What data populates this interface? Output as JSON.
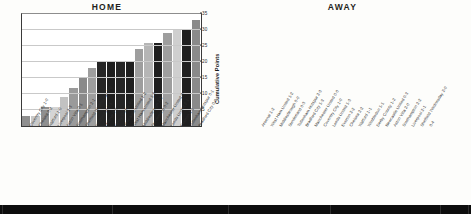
{
  "chart_data": [
    {
      "type": "bar",
      "title": "HOME",
      "xlabel": "",
      "ylabel": "Cumulative Points",
      "ylim": [
        0,
        35
      ],
      "yticks": [
        5,
        10,
        15,
        20,
        25,
        30,
        35
      ],
      "grid": true,
      "legend": "none",
      "categories": [
        "Coventry City 1-0",
        "Chelsea 0-2",
        "Watford 1-0",
        "Liverpool 2-3",
        "Aston Villa 0-1",
        "Southampton 2-1",
        "Sheffield Wednesday 3-0",
        "Wimbledon 2-1",
        "Arsenal 0-3",
        "Derby County 0-1",
        "Newcastle United 1-2",
        "West Ham United 1-3",
        "Middlesbrough 2-1",
        "Sunderland 0-2",
        "Manchester United 0-2",
        "Leeds United 2-1",
        "Everton 1-1",
        "Tottenham Hotspur 0-1",
        "Bradford City 0-0"
      ],
      "values": [
        3,
        3,
        6,
        6,
        9,
        12,
        15,
        18,
        20,
        20,
        20,
        20,
        24,
        26,
        26,
        29,
        30,
        30,
        33
      ],
      "bar_shades": [
        "#8f8f8f",
        "#c9c9c9",
        "#8f8f8f",
        "#d5d5d5",
        "#c2c2c2",
        "#9a9a9a",
        "#8a8a8a",
        "#9e9e9e",
        "#262626",
        "#1f1f1f",
        "#262626",
        "#1f1f1f",
        "#9e9e9e",
        "#b5b5b5",
        "#1f1f1f",
        "#9e9e9e",
        "#cfcfcf",
        "#1f1f1f",
        "#8a8a8a"
      ]
    },
    {
      "type": "bar",
      "title": "AWAY",
      "xlabel": "",
      "ylabel": "Cumulative Points",
      "ylim": [
        0,
        35
      ],
      "yticks": [
        5,
        10,
        15,
        20,
        25,
        30,
        35
      ],
      "grid": true,
      "legend": "none",
      "categories": [
        "Arsenal 1-2",
        "West Ham United 1-2",
        "Middlesbrough 0-0",
        "Sunderland 0-3",
        "Tottenham Hotspur 2-3",
        "Bradford City 1-3",
        "Manchester United 0-0",
        "Coventry City 1-0",
        "Leeds United 1-3",
        "Everton 2-2",
        "Chelsea 2-2",
        "Watford 1-1",
        "Wimbledon 1-1",
        "Derby County 1-2",
        "Newcastle United 0-3",
        "Aston Villa 2-0",
        "Southampton 2-2",
        "Liverpool 2-1",
        "Sheffield Wednesday 2-0",
        "0-4"
      ],
      "values": [
        0,
        0,
        1,
        1,
        1,
        1,
        2,
        5,
        5,
        6,
        7,
        8,
        9,
        9,
        9,
        12,
        13,
        16,
        20,
        22
      ],
      "bar_shades": [
        "#f2f2f2",
        "#f2f2f2",
        "#b5b5b5",
        "#9e9e9e",
        "#1f1f1f",
        "#1f1f1f",
        "#8f8f8f",
        "#9e9e9e",
        "#1f1f1f",
        "#1f1f1f",
        "#262626",
        "#a8a8a8",
        "#c9c9c9",
        "#d5d5d5",
        "#1f1f1f",
        "#1f1f1f",
        "#8a8a8a",
        "#cfcfcf",
        "#9e9e9e",
        "#7f7f7f"
      ]
    }
  ],
  "axis": {
    "ylabel": "Cumulative Points",
    "ticks": [
      "5",
      "10",
      "15",
      "20",
      "25",
      "30",
      "35"
    ]
  },
  "titles": {
    "home": "HOME",
    "away": "AWAY"
  },
  "colors": {
    "background": "#fdfdfb",
    "plot_background": "#ffffff",
    "axis": "#3a3a3a",
    "gridline": "#c9c9c9",
    "text": "#231f20",
    "footer": "#0d0d0d"
  }
}
